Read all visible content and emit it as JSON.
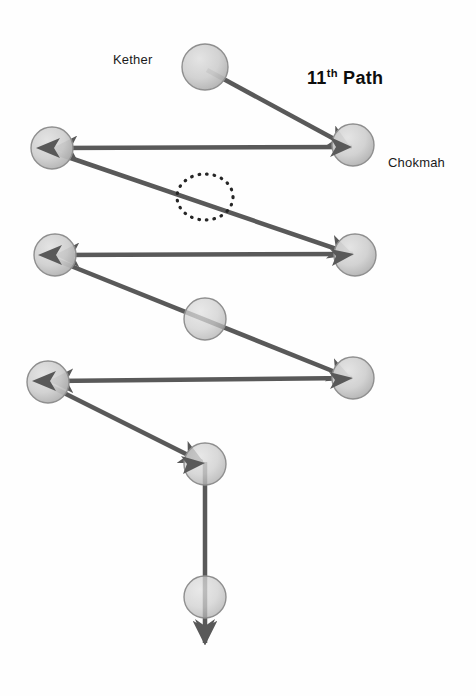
{
  "figure": {
    "background_color": "#fefefe",
    "node_fill_light": "#d8d8d8",
    "node_fill_dark": "#a8a8a8",
    "node_stroke": "#8a8a8a",
    "edge_color": "#595959",
    "dotted_color": "#262626",
    "text_color": "#1a1a1a"
  },
  "labels": {
    "kether": "Kether",
    "chokmah": "Chokmah",
    "path_number": "11",
    "path_ordinal_suffix": "th",
    "path_word": "Path"
  },
  "nodes": [
    {
      "id": "kether",
      "name": "Kether",
      "cx": 205,
      "cy": 67,
      "r": 23
    },
    {
      "id": "chokmah",
      "name": "Chokmah",
      "cx": 353,
      "cy": 145,
      "r": 21
    },
    {
      "id": "binah",
      "name": "",
      "cx": 52,
      "cy": 148,
      "r": 21
    },
    {
      "id": "chesed",
      "name": "",
      "cx": 355,
      "cy": 255,
      "r": 21
    },
    {
      "id": "geburah",
      "name": "",
      "cx": 55,
      "cy": 255,
      "r": 21
    },
    {
      "id": "tiphareth",
      "name": "",
      "cx": 205,
      "cy": 319,
      "r": 21
    },
    {
      "id": "netzach",
      "name": "",
      "cx": 353,
      "cy": 378,
      "r": 21
    },
    {
      "id": "hod",
      "name": "",
      "cx": 48,
      "cy": 382,
      "r": 21
    },
    {
      "id": "yesod",
      "name": "",
      "cx": 205,
      "cy": 464,
      "r": 21
    },
    {
      "id": "malkuth",
      "name": "",
      "cx": 205,
      "cy": 597,
      "r": 21
    }
  ],
  "edges": [
    {
      "id": "edge-kether-chokmah",
      "from": "kether",
      "to": "chokmah",
      "x1": 207,
      "y1": 70,
      "x2": 349,
      "y2": 147,
      "arrow": "end"
    },
    {
      "id": "edge-chokmah-binah",
      "from": "chokmah",
      "to": "binah",
      "x1": 352,
      "y1": 147,
      "x2": 52,
      "y2": 148,
      "arrow": "end"
    },
    {
      "id": "edge-binah-chesed",
      "from": "binah",
      "to": "chesed",
      "x1": 53,
      "y1": 152,
      "x2": 353,
      "y2": 254,
      "arrow": "end"
    },
    {
      "id": "edge-chesed-geburah",
      "from": "chesed",
      "to": "geburah",
      "x1": 353,
      "y1": 254,
      "x2": 54,
      "y2": 255,
      "arrow": "end"
    },
    {
      "id": "edge-geburah-netzach",
      "from": "geburah",
      "to": "netzach",
      "x1": 56,
      "y1": 260,
      "x2": 352,
      "y2": 378,
      "arrow": "end"
    },
    {
      "id": "edge-netzach-hod",
      "from": "netzach",
      "to": "hod",
      "x1": 352,
      "y1": 378,
      "x2": 48,
      "y2": 381,
      "arrow": "end"
    },
    {
      "id": "edge-hod-yesod",
      "from": "hod",
      "to": "yesod",
      "x1": 50,
      "y1": 386,
      "x2": 204,
      "y2": 463,
      "arrow": "end"
    },
    {
      "id": "edge-yesod-malkuth-exit",
      "from": "yesod",
      "to": "exit",
      "x1": 205,
      "y1": 462,
      "x2": 205,
      "y2": 645,
      "arrow": "end"
    }
  ],
  "annotations": [
    {
      "id": "dotted-ellipse",
      "name": "dotted-highlight-ellipse",
      "cx": 205,
      "cy": 197,
      "rx": 28,
      "ry": 23
    }
  ]
}
